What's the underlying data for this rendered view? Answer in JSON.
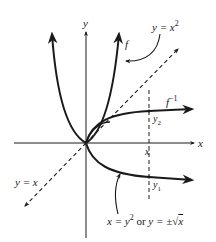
{
  "figure": {
    "labels": {
      "y_axis": "y",
      "x_axis": "x",
      "f": "f",
      "f_inverse_base": "f",
      "f_inverse_sup": "−1",
      "parabola_eq_base": "y = x",
      "parabola_eq_sup": "2",
      "identity_line": "y = x",
      "y2_base": "y",
      "y2_sub": "2",
      "y1_base": "y",
      "y1_sub": "1",
      "x_marker": "x",
      "inverse_eq_part1": "x = y",
      "inverse_eq_sup": "2",
      "inverse_eq_or": " or ",
      "inverse_eq_part2": "y = ±",
      "inverse_eq_radicand": "x"
    },
    "colors": {
      "ink": "#1a1a1a",
      "background": "#ffffff"
    },
    "curves": [
      {
        "name": "f",
        "equation": "y = x^2",
        "style": "solid-thick"
      },
      {
        "name": "f_inverse",
        "equation": "x = y^2 (y = ±√x)",
        "style": "solid-thick"
      },
      {
        "name": "identity",
        "equation": "y = x",
        "style": "dashed"
      },
      {
        "name": "vertical_marker",
        "equation": "x = const",
        "style": "dashed"
      }
    ]
  }
}
